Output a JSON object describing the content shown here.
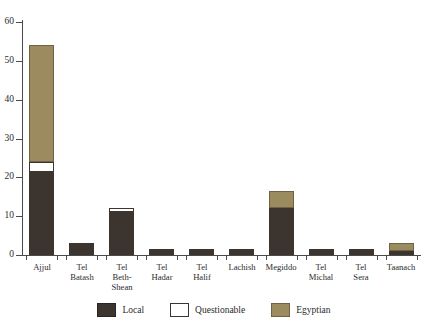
{
  "chart_data": {
    "type": "bar",
    "stacked": true,
    "title": "",
    "subtitle": "",
    "xlabel": "",
    "ylabel": "",
    "ylim": [
      0,
      60
    ],
    "ytick_labels": [
      "0",
      "10",
      "20",
      "30",
      "40",
      "50",
      "60"
    ],
    "ytick_values": [
      0,
      10,
      20,
      30,
      40,
      50,
      60
    ],
    "grid": false,
    "legend_position": "bottom-center",
    "categories": [
      "Ajjul",
      "Tel\nBatash",
      "Tel\nBeth-Shean",
      "Tel\nHadar",
      "Tel\nHalif",
      "Lachish",
      "Megiddo",
      "Tel\nMichal",
      "Tel\nSera",
      "Taanach"
    ],
    "series": [
      {
        "name": "Local",
        "color": "#3b342f",
        "values": [
          21.5,
          3,
          11,
          1.5,
          1.5,
          1.5,
          12,
          1.5,
          1.5,
          1
        ]
      },
      {
        "name": "Questionable",
        "color": "#ffffff",
        "values": [
          2.5,
          0,
          1,
          0,
          0,
          0,
          0,
          0,
          0,
          0
        ]
      },
      {
        "name": "Egyptian",
        "color": "#9b8b5e",
        "values": [
          30,
          0,
          0,
          0,
          0,
          0,
          4.5,
          0,
          0,
          2
        ]
      }
    ],
    "totals": [
      54,
      3,
      12,
      1.5,
      1.5,
      1.5,
      16.5,
      1.5,
      1.5,
      3
    ]
  },
  "legend": {
    "items": [
      {
        "label": "Local",
        "swatch": "local-swatch"
      },
      {
        "label": "Questionable",
        "swatch": "questionable-swatch"
      },
      {
        "label": "Egyptian",
        "swatch": "egyptian-swatch"
      }
    ]
  },
  "colors": {
    "local": "#3b342f",
    "questionable": "#ffffff",
    "egyptian": "#9b8b5e",
    "axis": "#4a4a4a",
    "text": "#2b2b2b",
    "background": "#ffffff"
  }
}
